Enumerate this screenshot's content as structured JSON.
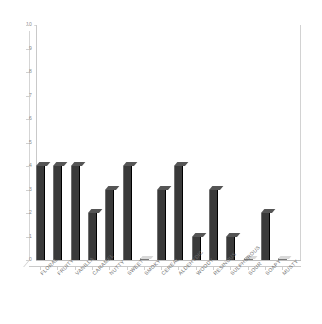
{
  "chart_data": {
    "type": "bar",
    "title": "",
    "subtitle": "",
    "xlabel": "",
    "ylabel": "",
    "ylim": [
      0,
      10
    ],
    "ytick_values": [
      0,
      1,
      2,
      3,
      4,
      5,
      6,
      7,
      8,
      9,
      10
    ],
    "grid": false,
    "legend": null,
    "legend_position": "none",
    "style": "3d-column",
    "bar_color": "#3a3a3a",
    "axis_color": "#c9c9c9",
    "label_color": "#6f6f6f",
    "categories": [
      "FLORAL",
      "FRUITY",
      "VANILLA",
      "CARAMEL",
      "NUTTY",
      "SWEET",
      "SMOKY",
      "CEREAL",
      "ALDEHYDIC",
      "WOODY",
      "RESINOUS",
      "SULPHUROUS",
      "SOUR",
      "SOAPY",
      "MUSTY"
    ],
    "values": [
      4,
      4,
      4,
      2,
      3,
      4,
      0,
      3,
      4,
      1,
      3,
      1,
      0,
      2,
      0
    ]
  }
}
